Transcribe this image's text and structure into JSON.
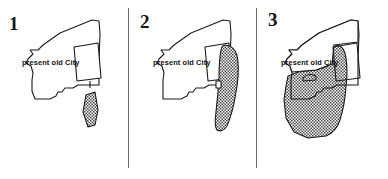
{
  "figure": {
    "background_color": "#ffffff",
    "outline_color": "#1a1a1a",
    "hatch_color": "#8a8a8a",
    "divider_color": "#6e6e6e",
    "width": 388,
    "height": 179
  },
  "panels": [
    {
      "id": "panel-1",
      "number": "1",
      "label": "present old City",
      "shaded_regions": 1,
      "description": "city outline with tilted inner block and one small narrow shaded strip outside to the south-east"
    },
    {
      "id": "panel-2",
      "number": "2",
      "label": "present old City",
      "shaded_regions": 1,
      "description": "city outline with an enlarged elongated shaded lobe along the eastern edge overlapping the inner block"
    },
    {
      "id": "panel-3",
      "number": "3",
      "label": "present old City",
      "shaded_regions": 1,
      "description": "city outline with a large shaded area covering the entire southern and eastern portion"
    }
  ],
  "dividers": [
    {
      "id": "divider-1",
      "orientation": "vertical"
    },
    {
      "id": "divider-2",
      "orientation": "vertical"
    }
  ]
}
